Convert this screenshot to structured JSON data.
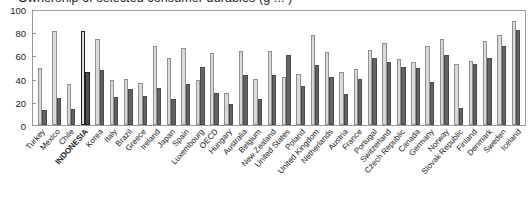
{
  "chart_data": {
    "type": "bar",
    "title": "Ownership of selected consumer durables (g ... )",
    "xlabel": "",
    "ylabel": "",
    "ylim": [
      0,
      100
    ],
    "yticks": [
      0,
      20,
      40,
      60,
      80,
      100
    ],
    "grid": false,
    "legend_position": "none",
    "highlight_category": "INDONESIA",
    "categories": [
      "Turkey",
      "Mexico",
      "Chile",
      "INDONESIA",
      "Korea",
      "Italy",
      "Brazil",
      "Greece",
      "Ireland",
      "Japan",
      "Spain",
      "Luxembourg",
      "OECD",
      "Hungary",
      "Australia",
      "Belgium",
      "New Zealand",
      "United States",
      "Poland",
      "United Kingdom",
      "Netherlands",
      "Austria",
      "France",
      "Portugal",
      "Switzerland",
      "Czech Republic",
      "Canada",
      "Germany",
      "Norway",
      "Slovak Republic",
      "Finland",
      "Denmark",
      "Sweden",
      "Iceland"
    ],
    "series": [
      {
        "name": "Series 1",
        "color": "#d9d9d9",
        "values": [
          49,
          81,
          35,
          81,
          74,
          39,
          40,
          36,
          68,
          58,
          66,
          39,
          62,
          28,
          64,
          40,
          64,
          41,
          44,
          78,
          63,
          46,
          48,
          65,
          71,
          57,
          54,
          68,
          74,
          53,
          55,
          72,
          78,
          90
        ]
      },
      {
        "name": "Series 2",
        "color": "#636363",
        "values": [
          13,
          23,
          14,
          46,
          47,
          24,
          31,
          25,
          32,
          22,
          35,
          50,
          28,
          18,
          43,
          22,
          43,
          60,
          34,
          52,
          41,
          27,
          40,
          58,
          54,
          50,
          49,
          37,
          60,
          15,
          53,
          58,
          68,
          82
        ]
      }
    ]
  }
}
